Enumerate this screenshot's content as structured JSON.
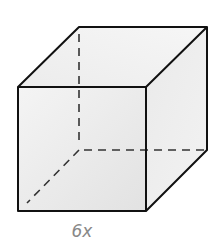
{
  "figure": {
    "type": "cube",
    "side_label": "6x",
    "colors": {
      "edge": "#111111",
      "hidden_edge": "#333333",
      "face_front": "#f0f0f0",
      "face_top": "#e8e8e8",
      "face_right": "#e4e4e4",
      "label": "#888888"
    }
  }
}
